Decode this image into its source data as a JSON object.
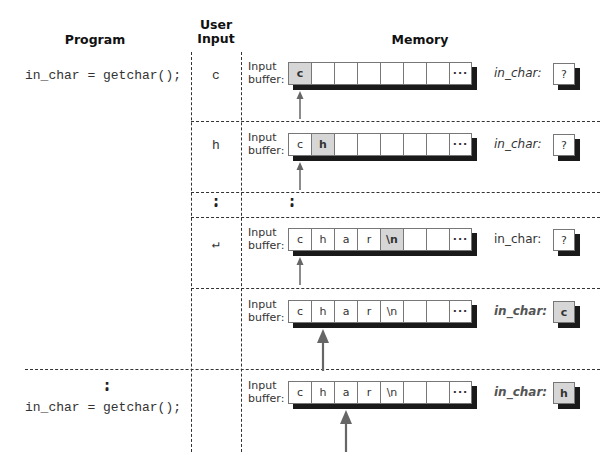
{
  "headers": {
    "program": "Program",
    "user_input_line1": "User",
    "user_input_line2": "Input",
    "memory": "Memory"
  },
  "program": {
    "stmt1": "in_char = getchar();",
    "stmt2": "in_char = getchar();",
    "ellipsis": "⋮"
  },
  "user_inputs": [
    "c",
    "h",
    "⋮",
    "↵",
    ""
  ],
  "buffer_label": {
    "line1": "Input",
    "line2": "buffer:"
  },
  "rows": [
    {
      "cells": [
        "c",
        "",
        "",
        "",
        "",
        "",
        "",
        "···"
      ],
      "highlight": 0,
      "var_label": "in_char:",
      "var_value": "?",
      "var_hl": false,
      "arrow_cell": 0,
      "arrow_large": false
    },
    {
      "cells": [
        "c",
        "h",
        "",
        "",
        "",
        "",
        "",
        "···"
      ],
      "highlight": 1,
      "var_label": "in_char:",
      "var_value": "?",
      "var_hl": false,
      "arrow_cell": 0,
      "arrow_large": false
    },
    {
      "cells": [
        "c",
        "h",
        "a",
        "r",
        "\\n",
        "",
        "",
        "···"
      ],
      "highlight": 4,
      "var_label": "in_char:",
      "var_value": "?",
      "var_hl": false,
      "arrow_cell": 0,
      "arrow_large": false
    },
    {
      "cells": [
        "c",
        "h",
        "a",
        "r",
        "\\n",
        "",
        "",
        "···"
      ],
      "highlight": -1,
      "var_label": "in_char:",
      "var_value": "c",
      "var_hl": true,
      "arrow_cell": 1,
      "arrow_large": true
    },
    {
      "cells": [
        "c",
        "h",
        "a",
        "r",
        "\\n",
        "",
        "",
        "···"
      ],
      "highlight": -1,
      "var_label": "in_char:",
      "var_value": "h",
      "var_hl": true,
      "arrow_cell": 2,
      "arrow_large": true
    }
  ],
  "memory_ellipsis": "⋮",
  "colors": {
    "highlight": "#d6d6d6",
    "shadow": "#1a1a1a",
    "arrow": "#666666",
    "dash": "#333333"
  }
}
